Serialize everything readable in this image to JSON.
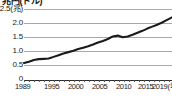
{
  "chart": {
    "title": "兆円(ドル)",
    "unit_label": "(兆)",
    "x_axis_unit": "(年)"
  },
  "chart_data": {
    "type": "line",
    "title": "兆円(ドル)",
    "xlabel": "(年)",
    "ylabel": "(兆)",
    "ylim": [
      0,
      2.5
    ],
    "xlim": [
      1989,
      2019
    ],
    "grid": true,
    "legend": "none",
    "ytick_labels": [
      "2.5(兆)",
      "2.0",
      "1.5",
      "1.0",
      "0.5",
      "0"
    ],
    "ytick_values": [
      2.5,
      2.0,
      1.5,
      1.0,
      0.5,
      0
    ],
    "xtick_labels": [
      "1989",
      "1995",
      "2000",
      "2005",
      "2010",
      "2015",
      "2019(年)"
    ],
    "xtick_values": [
      1989,
      1995,
      2000,
      2005,
      2010,
      2015,
      2019
    ],
    "x": [
      1989,
      1990,
      1991,
      1992,
      1993,
      1994,
      1995,
      1996,
      1997,
      1998,
      1999,
      2000,
      2001,
      2002,
      2003,
      2004,
      2005,
      2006,
      2007,
      2008,
      2009,
      2010,
      2011,
      2012,
      2013,
      2014,
      2015,
      2016,
      2017,
      2018,
      2019
    ],
    "values": [
      0.57,
      0.62,
      0.68,
      0.71,
      0.72,
      0.73,
      0.79,
      0.85,
      0.91,
      0.96,
      1.01,
      1.07,
      1.12,
      1.17,
      1.23,
      1.3,
      1.36,
      1.43,
      1.52,
      1.55,
      1.49,
      1.52,
      1.58,
      1.65,
      1.72,
      1.8,
      1.87,
      1.94,
      2.02,
      2.11,
      2.2
    ],
    "line_color": "#1a1a1a",
    "grid_color": "#a8a8a8"
  }
}
